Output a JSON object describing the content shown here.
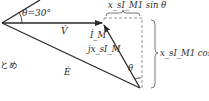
{
  "diagram": {
    "type": "phasor-diagram",
    "angle_label": "θ=30°",
    "labels": {
      "V": "V̇",
      "I_M": "İ_M",
      "jxI_M": "jx_sI_M",
      "E": "Ė",
      "theta_bottom": "θ",
      "sin_term": "x_sI_M1 sin θ",
      "cos_term": "x_sI_M1 cos θ",
      "left_fragment": "とめ"
    },
    "colors": {
      "line": "#2a2a2a",
      "dashed": "#8a8a8a"
    }
  }
}
